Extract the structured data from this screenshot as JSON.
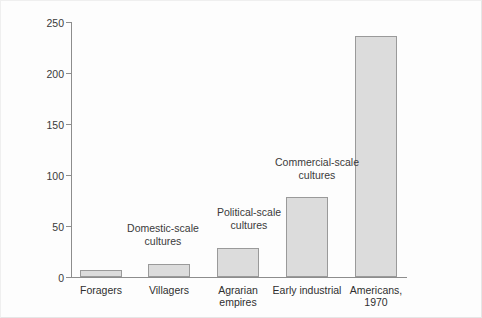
{
  "figure": {
    "background": "#fdfdfd",
    "bar_fill": "#dcdcdc",
    "bar_stroke": "#9a9a9a",
    "axis_color": "#8d8d8d",
    "text_color": "#2f2f2f"
  },
  "chart_data": {
    "type": "bar",
    "title": "",
    "xlabel": "",
    "ylabel": "Daily per-capita consumption (1000 kcal)",
    "ylim": [
      0,
      250
    ],
    "yticks": [
      0,
      50,
      100,
      150,
      200,
      250
    ],
    "ytick_labels": [
      "0",
      "50",
      "100",
      "150",
      "200",
      "250"
    ],
    "grid": false,
    "legend": "none",
    "categories": [
      "Foragers",
      "Villagers",
      "Agrarian\nempires",
      "Early industrial",
      "Americans,\n1970"
    ],
    "values": [
      7,
      13,
      28,
      78,
      236
    ],
    "annotations": [
      {
        "text": "Domestic-scale\ncultures",
        "over_categories": [
          "Foragers",
          "Villagers"
        ]
      },
      {
        "text": "Political-scale\ncultures",
        "over_categories": [
          "Agrarian empires"
        ]
      },
      {
        "text": "Commercial-scale\ncultures",
        "over_categories": [
          "Early industrial"
        ]
      }
    ]
  }
}
